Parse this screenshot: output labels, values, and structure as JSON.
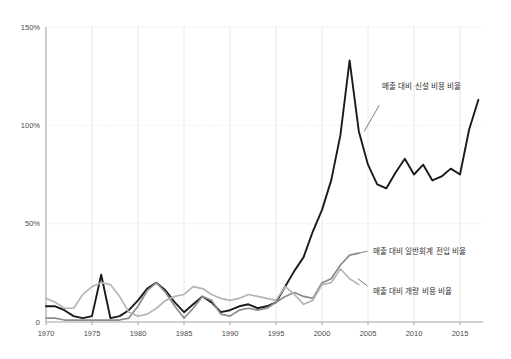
{
  "chart_data": {
    "type": "line",
    "title": "",
    "xlabel": "",
    "ylabel": "",
    "xlim": [
      1970,
      2017.5
    ],
    "ylim": [
      0,
      150
    ],
    "grid": true,
    "legend_position": "inline-right",
    "y_ticks": [
      "0",
      "50%",
      "100%",
      "150%"
    ],
    "y_tick_values": [
      0,
      50,
      100,
      150
    ],
    "x_ticks": [
      "1970",
      "1975",
      "1980",
      "1985",
      "1990",
      "1995",
      "2000",
      "2005",
      "2010",
      "2015"
    ],
    "x_tick_values": [
      1970,
      1975,
      1980,
      1985,
      1990,
      1995,
      2000,
      2005,
      2010,
      2015
    ],
    "series": [
      {
        "name": "매출 대비 신설 비용 비율",
        "color": "#1a1a1a",
        "width": 1.9,
        "label_x": 2006.5,
        "label_y": 120,
        "x": [
          1970,
          1971,
          1972,
          1973,
          1974,
          1975,
          1976,
          1977,
          1978,
          1979,
          1980,
          1981,
          1982,
          1983,
          1984,
          1985,
          1986,
          1987,
          1988,
          1989,
          1990,
          1991,
          1992,
          1993,
          1994,
          1995,
          1996,
          1997,
          1998,
          1999,
          2000,
          2001,
          2002,
          2003,
          2004,
          2005,
          2006,
          2007,
          2008,
          2009,
          2010,
          2011,
          2012,
          2013,
          2014,
          2015,
          2016,
          2017
        ],
        "y": [
          8,
          8,
          6,
          3,
          2,
          3,
          24,
          2,
          3,
          6,
          11,
          17,
          20,
          16,
          10,
          5,
          9,
          13,
          10,
          5,
          6,
          8,
          9,
          7,
          8,
          10,
          18,
          26,
          33,
          46,
          57,
          72,
          95,
          133,
          97,
          80,
          70,
          68,
          76,
          83,
          75,
          80,
          72,
          74,
          78,
          75,
          98,
          113
        ]
      },
      {
        "name": "매출 대비 일반회계 전입 비율",
        "color": "#8c8c8c",
        "width": 1.7,
        "label_x": 2005.5,
        "label_y": 36,
        "x": [
          1970,
          1971,
          1972,
          1973,
          1974,
          1975,
          1976,
          1977,
          1978,
          1979,
          1980,
          1981,
          1982,
          1983,
          1984,
          1985,
          1986,
          1987,
          1988,
          1989,
          1990,
          1991,
          1992,
          1993,
          1994,
          1995,
          1996,
          1997,
          1998,
          1999,
          2000,
          2001,
          2002,
          2003,
          2004
        ],
        "y": [
          2,
          2,
          1,
          1,
          1,
          1,
          1,
          1,
          1,
          2,
          8,
          16,
          20,
          15,
          8,
          2,
          7,
          13,
          11,
          4,
          3,
          6,
          7,
          6,
          7,
          10,
          13,
          15,
          13,
          12,
          20,
          22,
          29,
          34,
          35
        ]
      },
      {
        "name": "매출 대비 개량 비용 비율",
        "color": "#b5b5b5",
        "width": 1.7,
        "label_x": 2005.5,
        "label_y": 16,
        "x": [
          1970,
          1971,
          1972,
          1973,
          1974,
          1975,
          1976,
          1977,
          1978,
          1979,
          1980,
          1981,
          1982,
          1983,
          1984,
          1985,
          1986,
          1987,
          1988,
          1989,
          1990,
          1991,
          1992,
          1993,
          1994,
          1995,
          1996,
          1997,
          1998,
          1999,
          2000,
          2001,
          2002,
          2003,
          2004
        ],
        "y": [
          12,
          10,
          7,
          7,
          14,
          18,
          20,
          19,
          13,
          5,
          3,
          4,
          7,
          11,
          13,
          14,
          18,
          17,
          14,
          12,
          11,
          12,
          14,
          13,
          12,
          11,
          18,
          14,
          9,
          11,
          19,
          20,
          27,
          22,
          19
        ]
      }
    ]
  },
  "leaders": [
    {
      "name": "leader-sinseol",
      "x1": 2006.2,
      "y1": 110,
      "x2": 2004.6,
      "y2": 97
    },
    {
      "name": "leader-ilban",
      "x1": 2004.9,
      "y1": 36,
      "x2": 2003.6,
      "y2": 34.5
    },
    {
      "name": "leader-gaeryang",
      "x1": 2004.9,
      "y1": 18.5,
      "x2": 2003.9,
      "y2": 22
    }
  ]
}
